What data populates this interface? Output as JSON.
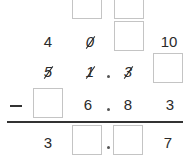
{
  "problem": {
    "type": "column-subtraction-with-borrowing",
    "borrow_row": {
      "tens_borrowed": "4",
      "ones_crossed": "0",
      "tenths_carry": "10"
    },
    "minuend": {
      "tens": "5",
      "ones": "1",
      "decimal_point": ".",
      "tenths": "3",
      "hundredths": ""
    },
    "operator": "−",
    "subtrahend": {
      "tens": "",
      "ones": "6",
      "decimal_point": ".",
      "tenths": "8",
      "hundredths": "3"
    },
    "difference": {
      "tens": "3",
      "ones": "",
      "decimal_point": ".",
      "tenths": "",
      "hundredths": "7"
    },
    "blank_boxes": 7
  }
}
